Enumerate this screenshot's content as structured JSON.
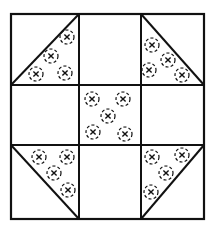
{
  "diagram": {
    "colors": {
      "line": "#111111",
      "background": "#ffffff"
    },
    "outer_box": {
      "x1": 11,
      "y1": 14,
      "x2": 204,
      "y2": 219
    },
    "grid": {
      "vertical_lines": [
        79,
        141
      ],
      "horizontal_lines": [
        85,
        145
      ]
    },
    "triangles": [
      {
        "cell": "top-left",
        "diagonal": [
          [
            11,
            85
          ],
          [
            79,
            14
          ]
        ],
        "filled_half": "lower-right",
        "circles": [
          [
            67,
            37
          ],
          [
            51,
            56
          ],
          [
            36,
            74
          ],
          [
            65,
            73
          ]
        ]
      },
      {
        "cell": "top-right",
        "diagonal": [
          [
            141,
            14
          ],
          [
            204,
            85
          ]
        ],
        "filled_half": "lower-left",
        "circles": [
          [
            152,
            45
          ],
          [
            168,
            60
          ],
          [
            149,
            70
          ],
          [
            182,
            75
          ]
        ]
      },
      {
        "cell": "bottom-left",
        "diagonal": [
          [
            11,
            145
          ],
          [
            79,
            219
          ]
        ],
        "filled_half": "upper-right",
        "circles": [
          [
            39,
            157
          ],
          [
            67,
            157
          ],
          [
            54,
            173
          ],
          [
            68,
            190
          ]
        ]
      },
      {
        "cell": "bottom-right",
        "diagonal": [
          [
            141,
            219
          ],
          [
            204,
            145
          ]
        ],
        "filled_half": "upper-left",
        "circles": [
          [
            152,
            157
          ],
          [
            182,
            155
          ],
          [
            166,
            173
          ],
          [
            151,
            192
          ]
        ]
      }
    ],
    "center_circles": [
      [
        92,
        99
      ],
      [
        123,
        99
      ],
      [
        108,
        116
      ],
      [
        93,
        132
      ],
      [
        125,
        134
      ]
    ],
    "circle_radius": 7
  }
}
